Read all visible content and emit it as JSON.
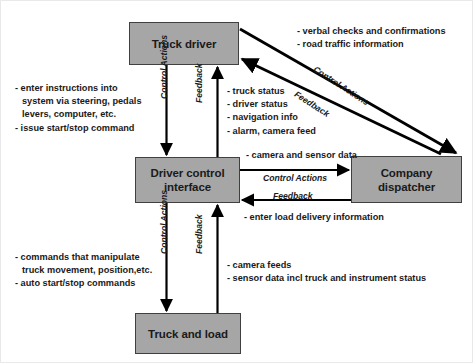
{
  "diagram": {
    "box_fill": "#a6a6a6",
    "box_stroke": "#404040",
    "arrow_color": "#000000",
    "boxes": {
      "truck_driver": "Truck driver",
      "driver_control_interface_line1": "Driver control",
      "driver_control_interface_line2": "interface",
      "company_dispatcher_line1": "Company",
      "company_dispatcher_line2": "dispatcher",
      "truck_and_load": "Truck and load"
    },
    "notes": {
      "top_right": [
        "- verbal checks and confirmations",
        "- road traffic information"
      ],
      "left_upper": [
        "- enter instructions into",
        "system via steering, pedals",
        "levers, computer, etc.",
        "- issue start/stop command"
      ],
      "mid_upper": [
        "- truck status",
        "- driver status",
        "- navigation info",
        "- alarm, camera feed"
      ],
      "camera_sensor_data": "- camera and sensor data",
      "load_delivery": "- enter load delivery information",
      "left_lower": [
        "- commands that manipulate",
        "truck movement, position,etc.",
        "- auto start/stop commands"
      ],
      "bottom_right": [
        "- camera feeds",
        "- sensor data incl truck and instrument status"
      ]
    },
    "arrow_labels": {
      "control_actions_driver_to_interface": "Control Actions",
      "feedback_interface_to_driver": "Feedback",
      "control_actions_interface_to_truck": "Control Actions",
      "feedback_truck_to_interface": "Feedback",
      "control_actions_interface_to_dispatcher": "Control Actions",
      "feedback_dispatcher_to_interface": "Feedback",
      "control_actions_driver_to_dispatcher": "Control Actions",
      "feedback_dispatcher_to_driver": "Feedback"
    }
  }
}
